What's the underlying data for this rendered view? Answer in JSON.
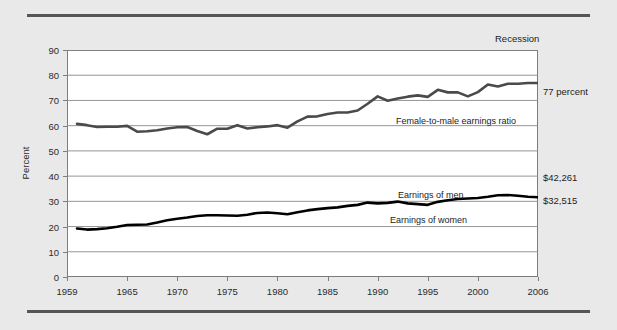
{
  "figure": {
    "background_color": "#e9e9e9",
    "plot_background_color": "#ffffff",
    "top_rule_color": "#555555",
    "bottom_rule_color": "#555555"
  },
  "annotations": {
    "recession": "Recession",
    "end_ratio": "77 percent",
    "men_earnings_value": "$42,261",
    "women_earnings_value": "$32,515"
  },
  "chart_data": {
    "type": "line",
    "title": "",
    "subtitle": "",
    "xlabel": "",
    "ylabel": "Percent",
    "xlim": [
      1959,
      2006
    ],
    "ylim": [
      0,
      90
    ],
    "ytick_values": [
      0,
      10,
      20,
      30,
      40,
      50,
      60,
      70,
      80,
      90
    ],
    "ytick_labels": [
      "0",
      "10",
      "20",
      "30",
      "40",
      "50",
      "60",
      "70",
      "80",
      "90"
    ],
    "xtick_values": [
      1959,
      1965,
      1970,
      1975,
      1980,
      1985,
      1990,
      1995,
      2000,
      2006
    ],
    "xtick_labels": [
      "1959",
      "1965",
      "1970",
      "1975",
      "1980",
      "1985",
      "1990",
      "1995",
      "2000",
      "2006"
    ],
    "grid": "horizontal",
    "grid_color": "#8a8a8a",
    "legend_position": "inline-labels",
    "x": [
      1960,
      1961,
      1962,
      1963,
      1964,
      1965,
      1966,
      1967,
      1968,
      1969,
      1970,
      1971,
      1972,
      1973,
      1974,
      1975,
      1976,
      1977,
      1978,
      1979,
      1980,
      1981,
      1982,
      1983,
      1984,
      1985,
      1986,
      1987,
      1988,
      1989,
      1990,
      1991,
      1992,
      1993,
      1994,
      1995,
      1996,
      1997,
      1998,
      1999,
      2000,
      2001,
      2002,
      2003,
      2004,
      2005,
      2006
    ],
    "series": [
      {
        "name": "Female-to-male earnings ratio",
        "label": "Female-to-male earnings ratio",
        "color": "#4a4a4a",
        "width": 2.6,
        "values": [
          60.7,
          60.2,
          59.5,
          59.6,
          59.6,
          59.9,
          57.6,
          57.8,
          58.2,
          58.9,
          59.4,
          59.5,
          57.9,
          56.6,
          58.8,
          58.8,
          60.2,
          58.9,
          59.4,
          59.7,
          60.2,
          59.2,
          61.7,
          63.6,
          63.7,
          64.6,
          65.2,
          65.2,
          66.0,
          68.7,
          71.6,
          69.9,
          70.8,
          71.5,
          72.0,
          71.4,
          74.2,
          73.2,
          73.2,
          71.6,
          73.3,
          76.3,
          75.5,
          76.6,
          76.6,
          76.9,
          76.9
        ]
      },
      {
        "name": "Earnings of women",
        "label": "Earnings of women",
        "color": "#000000",
        "width": 2.6,
        "values": [
          19.2,
          18.8,
          19.0,
          19.3,
          19.9,
          20.6,
          20.7,
          20.8,
          21.6,
          22.5,
          23.1,
          23.6,
          24.2,
          24.5,
          24.5,
          24.4,
          24.3,
          24.7,
          25.4,
          25.6,
          25.3,
          24.9,
          25.7,
          26.4,
          26.9,
          27.3,
          27.6,
          28.2,
          28.6,
          29.5,
          29.2,
          29.4,
          29.9,
          29.2,
          28.9,
          28.6,
          29.8,
          30.4,
          30.9,
          31.1,
          31.3,
          31.8,
          32.4,
          32.5,
          32.2,
          31.8,
          31.6
        ]
      }
    ],
    "inline_labels": [
      {
        "text": "Female-to-male earnings ratio",
        "x_px": 396,
        "y_px": 116
      },
      {
        "text": "Earnings of men",
        "x_px": 398,
        "y_px": 190
      },
      {
        "text": "Earnings of women",
        "x_px": 390,
        "y_px": 215
      }
    ]
  }
}
